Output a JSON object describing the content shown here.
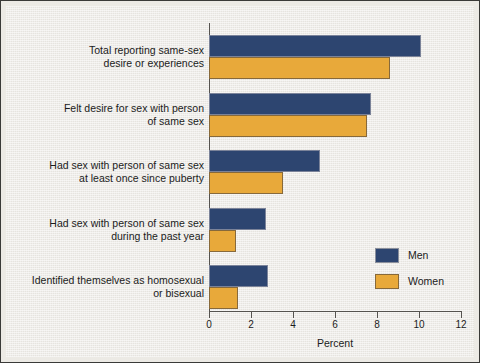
{
  "chart_data": {
    "type": "bar",
    "orientation": "horizontal",
    "title": "",
    "xlabel": "Percent",
    "ylabel": "",
    "xlim": [
      0,
      12
    ],
    "xticks": [
      0,
      2,
      4,
      6,
      8,
      10,
      12
    ],
    "xtick_labels": [
      "0",
      "2",
      "4",
      "6",
      "8",
      "10",
      "12"
    ],
    "grid": false,
    "legend_position": "inside-lower-right",
    "categories": [
      "Total reporting same-sex desire or experiences",
      "Felt desire for sex with person of same sex",
      "Had sex with person of same sex at least once since puberty",
      "Had sex with person of same sex during the past year",
      "Identified themselves as homosexual or bisexual"
    ],
    "category_lines": [
      [
        "Total reporting same-sex",
        "desire or experiences"
      ],
      [
        "Felt desire for sex with person",
        "of same sex"
      ],
      [
        "Had sex with person of same sex",
        "at least once since puberty"
      ],
      [
        "Had sex with person of same sex",
        "during the past year"
      ],
      [
        "Identified themselves as homosexual",
        "or bisexual"
      ]
    ],
    "series": [
      {
        "name": "Men",
        "color": "#2d4570",
        "values": [
          10.1,
          7.7,
          5.3,
          2.7,
          2.8
        ]
      },
      {
        "name": "Women",
        "color": "#e8a93a",
        "values": [
          8.6,
          7.5,
          3.5,
          1.3,
          1.4
        ]
      }
    ]
  },
  "legend": {
    "items": [
      {
        "label": "Men",
        "color": "#2d4570"
      },
      {
        "label": "Women",
        "color": "#e8a93a"
      }
    ]
  },
  "colors": {
    "men": "#2d4570",
    "women": "#e8a93a",
    "background": "#eceae5",
    "axis": "#55534f",
    "text": "#1b1b1b"
  }
}
